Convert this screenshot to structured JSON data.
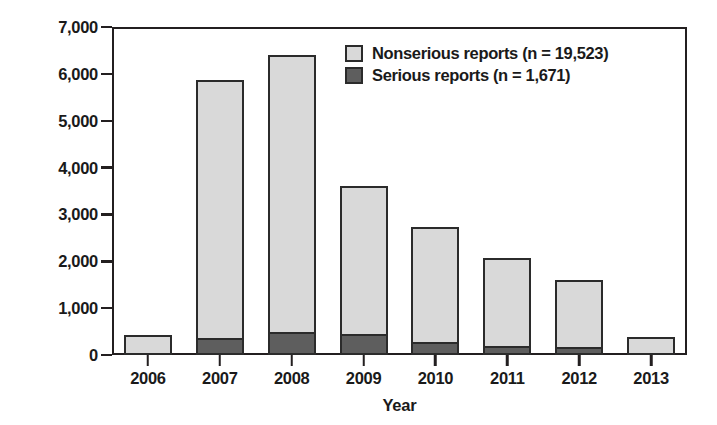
{
  "chart_data": {
    "type": "bar",
    "subtype": "stacked-bar",
    "title": "",
    "xlabel": "Year",
    "ylabel": "No. of reports",
    "categories": [
      "2006",
      "2007",
      "2008",
      "2009",
      "2010",
      "2011",
      "2012",
      "2013"
    ],
    "ylim": [
      0,
      7000
    ],
    "ytick_values": [
      0,
      1000,
      2000,
      3000,
      4000,
      5000,
      6000,
      7000
    ],
    "ytick_labels": [
      "0",
      "1,000",
      "2,000",
      "3,000",
      "4,000",
      "5,000",
      "6,000",
      "7,000"
    ],
    "grid": false,
    "legend_position": "top-right",
    "series": [
      {
        "name": "Nonserious reports (n = 19,523)",
        "short_name": "Nonserious reports",
        "n": "19,523",
        "color": "#d9d9d9",
        "values": [
          430,
          5550,
          5960,
          3200,
          2490,
          1930,
          1480,
          380
        ]
      },
      {
        "name": "Serious reports (n = 1,671)",
        "short_name": "Serious reports",
        "n": "1,671",
        "color": "#5e5e5e",
        "values": [
          0,
          310,
          440,
          400,
          240,
          140,
          120,
          0
        ]
      }
    ],
    "totals": [
      430,
      5860,
      6400,
      3600,
      2730,
      2070,
      1600,
      380
    ]
  },
  "legend": {
    "entries": [
      {
        "label": "Nonserious reports (n = 19,523)"
      },
      {
        "label": "Serious reports (n = 1,671)"
      }
    ]
  },
  "axes": {
    "y_title": "No. of reports",
    "x_title": "Year"
  }
}
